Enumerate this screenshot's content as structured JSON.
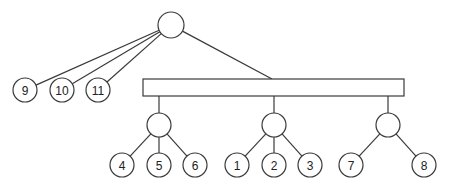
{
  "diagram": {
    "type": "tree",
    "root": {
      "id": "root",
      "cx": 171,
      "cy": 25,
      "r": 13,
      "label": ""
    },
    "bar": {
      "id": "bar",
      "x": 143,
      "y": 79,
      "width": 261,
      "height": 17
    },
    "internal_nodes": [
      {
        "id": "g1",
        "cx": 159,
        "cy": 125,
        "r": 12,
        "label": ""
      },
      {
        "id": "g2",
        "cx": 274,
        "cy": 125,
        "r": 12,
        "label": ""
      },
      {
        "id": "g3",
        "cx": 388,
        "cy": 125,
        "r": 12,
        "label": ""
      }
    ],
    "leaves": [
      {
        "id": "n9",
        "cx": 25,
        "cy": 90,
        "r": 12,
        "label": "9"
      },
      {
        "id": "n10",
        "cx": 62,
        "cy": 90,
        "r": 12,
        "label": "10"
      },
      {
        "id": "n11",
        "cx": 98,
        "cy": 90,
        "r": 12,
        "label": "11"
      },
      {
        "id": "n4",
        "cx": 122,
        "cy": 165,
        "r": 12,
        "label": "4"
      },
      {
        "id": "n5",
        "cx": 159,
        "cy": 165,
        "r": 12,
        "label": "5"
      },
      {
        "id": "n6",
        "cx": 195,
        "cy": 165,
        "r": 12,
        "label": "6"
      },
      {
        "id": "n1",
        "cx": 237,
        "cy": 165,
        "r": 12,
        "label": "1"
      },
      {
        "id": "n2",
        "cx": 274,
        "cy": 165,
        "r": 12,
        "label": "2"
      },
      {
        "id": "n3",
        "cx": 310,
        "cy": 165,
        "r": 12,
        "label": "3"
      },
      {
        "id": "n7",
        "cx": 351,
        "cy": 165,
        "r": 12,
        "label": "7"
      },
      {
        "id": "n8",
        "cx": 424,
        "cy": 165,
        "r": 12,
        "label": "8"
      }
    ],
    "edges": [
      {
        "from": "root",
        "to": "n9"
      },
      {
        "from": "root",
        "to": "n10"
      },
      {
        "from": "root",
        "to": "n11"
      },
      {
        "from": "root",
        "to": "bar"
      },
      {
        "from": "bar",
        "to": "g1"
      },
      {
        "from": "bar",
        "to": "g2"
      },
      {
        "from": "bar",
        "to": "g3"
      },
      {
        "from": "g1",
        "to": "n4"
      },
      {
        "from": "g1",
        "to": "n5"
      },
      {
        "from": "g1",
        "to": "n6"
      },
      {
        "from": "g2",
        "to": "n1"
      },
      {
        "from": "g2",
        "to": "n2"
      },
      {
        "from": "g2",
        "to": "n3"
      },
      {
        "from": "g3",
        "to": "n7"
      },
      {
        "from": "g3",
        "to": "n8"
      }
    ]
  }
}
